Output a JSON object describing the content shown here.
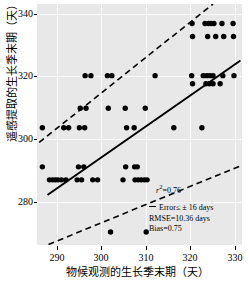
{
  "chart_data": {
    "type": "scatter",
    "title": "",
    "xlabel": "物候观测的生长季末期（天）",
    "ylabel": "遥感提取的生长季末期（天）",
    "xlim": [
      285.5,
      331.5
    ],
    "ylim": [
      268.0,
      342.0
    ],
    "xticks": [
      290,
      300,
      310,
      320,
      330
    ],
    "yticks": [
      280,
      300,
      320,
      340
    ],
    "grid": true,
    "legend_position": "bottom-right",
    "panel_background": "#e8e8e8",
    "gridline_color": "#fbfbfb",
    "marker_color": "#000000",
    "points": [
      [
        286.7,
        304.0
      ],
      [
        286.7,
        292.0
      ],
      [
        288.3,
        288.0
      ],
      [
        289.0,
        288.0
      ],
      [
        289.6,
        288.0
      ],
      [
        290.2,
        288.0
      ],
      [
        291.0,
        288.0
      ],
      [
        292.0,
        288.0
      ],
      [
        291.5,
        304.0
      ],
      [
        292.6,
        304.0
      ],
      [
        294.5,
        288.0
      ],
      [
        295.5,
        288.0
      ],
      [
        294.8,
        292.0
      ],
      [
        296.0,
        292.0
      ],
      [
        295.0,
        304.0
      ],
      [
        296.2,
        304.0
      ],
      [
        295.2,
        310.0
      ],
      [
        296.5,
        310.0
      ],
      [
        296.3,
        320.0
      ],
      [
        297.6,
        320.0
      ],
      [
        298.0,
        288.0
      ],
      [
        299.1,
        288.0
      ],
      [
        301.5,
        310.0
      ],
      [
        301.3,
        320.0
      ],
      [
        302.3,
        320.0
      ],
      [
        302.0,
        272.0
      ],
      [
        304.8,
        288.0
      ],
      [
        305.4,
        292.0
      ],
      [
        305.3,
        310.0
      ],
      [
        305.6,
        304.0
      ],
      [
        307.4,
        292.0
      ],
      [
        308.0,
        292.0
      ],
      [
        307.3,
        304.0
      ],
      [
        307.5,
        288.0
      ],
      [
        308.2,
        288.0
      ],
      [
        308.9,
        288.0
      ],
      [
        309.6,
        288.0
      ],
      [
        310.2,
        288.0
      ],
      [
        310.0,
        272.0
      ],
      [
        309.8,
        310.0
      ],
      [
        312.0,
        320.0
      ],
      [
        316.2,
        304.0
      ],
      [
        320.3,
        336.0
      ],
      [
        320.4,
        332.0
      ],
      [
        320.2,
        320.0
      ],
      [
        320.4,
        317.5
      ],
      [
        322.5,
        304.0
      ],
      [
        323.2,
        336.0
      ],
      [
        324.0,
        336.0
      ],
      [
        324.6,
        336.0
      ],
      [
        325.2,
        336.0
      ],
      [
        323.8,
        332.0
      ],
      [
        325.6,
        332.0
      ],
      [
        322.8,
        320.0
      ],
      [
        323.6,
        320.0
      ],
      [
        324.3,
        320.0
      ],
      [
        325.0,
        320.0
      ],
      [
        323.4,
        317.5
      ],
      [
        324.2,
        317.5
      ],
      [
        325.0,
        317.5
      ],
      [
        327.0,
        336.0
      ],
      [
        329.5,
        336.0
      ],
      [
        327.4,
        332.0
      ],
      [
        329.6,
        332.0
      ],
      [
        327.2,
        320.0
      ],
      [
        329.7,
        320.0
      ],
      [
        326.6,
        317.5
      ]
    ],
    "fit_line": {
      "x": [
        288.0,
        331.0
      ],
      "y": [
        283.5,
        324.5
      ],
      "style": "solid"
    },
    "upper_bound_line": {
      "x": [
        286.0,
        325.0
      ],
      "y": [
        299.5,
        342.0
      ],
      "style": "dashed"
    },
    "lower_bound_line": {
      "x": [
        286.0,
        331.5
      ],
      "y": [
        267.0,
        292.5
      ],
      "style": "dashed"
    },
    "annotations": {
      "r_squared_prefix": "r",
      "r_squared_sup": "2",
      "r_squared_value": "=0.76",
      "error_legend": "Error≤ ± 16 days",
      "rmse": "RMSE=10.36 days",
      "bias": "Bias=0.75"
    }
  }
}
